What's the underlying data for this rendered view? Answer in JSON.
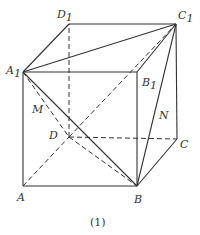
{
  "figure": {
    "caption": "(1)",
    "colors": {
      "line": "#333333",
      "label": "#333333",
      "background": "#ffffff"
    },
    "vertices": {
      "A": {
        "label": "A",
        "sub": "",
        "x": 23,
        "y": 186
      },
      "B": {
        "label": "B",
        "sub": "",
        "x": 137,
        "y": 186
      },
      "C": {
        "label": "C",
        "sub": "",
        "x": 177,
        "y": 139
      },
      "D": {
        "label": "D",
        "sub": "",
        "x": 69,
        "y": 137
      },
      "A1": {
        "label": "A",
        "sub": "1",
        "x": 23,
        "y": 72
      },
      "B1": {
        "label": "B",
        "sub": "1",
        "x": 137,
        "y": 72
      },
      "C1": {
        "label": "C",
        "sub": "1",
        "x": 176,
        "y": 24
      },
      "D1": {
        "label": "D",
        "sub": "1",
        "x": 69,
        "y": 24
      }
    },
    "points": {
      "M": {
        "label": "M"
      },
      "N": {
        "label": "N"
      }
    },
    "solid_edges": [
      "A-B",
      "B-C",
      "A-A1",
      "B-B1",
      "C-C1",
      "A1-B1",
      "B1-C1",
      "C1-D1",
      "D1-A1",
      "A1-C1",
      "A1-B",
      "B-C1"
    ],
    "dashed_edges": [
      "A-D",
      "D-C",
      "D-D1",
      "A1-D",
      "D-C1",
      "D-B"
    ]
  }
}
